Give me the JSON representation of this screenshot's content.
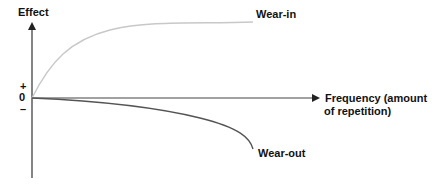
{
  "diagram": {
    "y_axis_label": "Effect",
    "x_axis_label_line1": "Frequency (amount",
    "x_axis_label_line2": "of repetition)",
    "plus_label": "+",
    "zero_label": "0",
    "minus_label": "–",
    "curves": [
      {
        "name": "Wear-in",
        "label": "Wear-in",
        "color": "#c8c8c8",
        "direction": "rising, saturating"
      },
      {
        "name": "Wear-out",
        "label": "Wear-out",
        "color": "#555555",
        "direction": "falling, accelerating"
      }
    ],
    "colors": {
      "axis": "#333333",
      "text": "#111111",
      "wear_in": "#c8c8c8",
      "wear_out": "#555555"
    }
  }
}
